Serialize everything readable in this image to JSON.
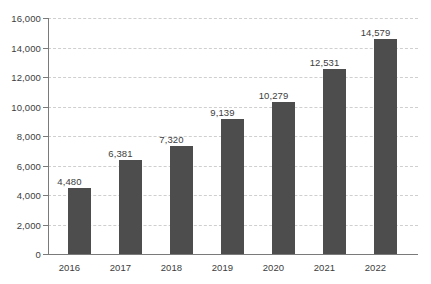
{
  "chart_data": {
    "type": "bar",
    "title": "",
    "subtitle": "",
    "xlabel": "",
    "ylabel": "",
    "categories": [
      "2016",
      "2017",
      "2018",
      "2019",
      "2020",
      "2021",
      "2022"
    ],
    "values": [
      4480,
      6381,
      7320,
      9139,
      10279,
      12531,
      14579
    ],
    "value_labels": [
      "4,480",
      "6,381",
      "7,320",
      "9,139",
      "10,279",
      "12,531",
      "14,579"
    ],
    "ylim": [
      0,
      16000
    ],
    "ytick_values": [
      0,
      2000,
      4000,
      6000,
      8000,
      10000,
      12000,
      14000,
      16000
    ],
    "ytick_labels": [
      "0",
      "2,000",
      "4,000",
      "6,000",
      "8,000",
      "10,000",
      "12,000",
      "14,000",
      "16,000"
    ],
    "grid": "horizontal-dashed",
    "legend": "none",
    "series": [
      {
        "name": "",
        "values": [
          4480,
          6381,
          7320,
          9139,
          10279,
          12531,
          14579
        ]
      }
    ],
    "colors": {
      "bar": "#4d4d4d",
      "gridline": "#cfcfcf",
      "axis": "#7a7a7a",
      "text": "#3d3d3d",
      "background": "#ffffff"
    }
  }
}
